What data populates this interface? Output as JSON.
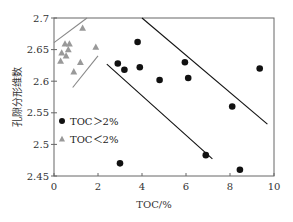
{
  "chart_data": {
    "type": "scatter",
    "title": "",
    "xlabel": "TOC/%",
    "ylabel": "孔隙分形维数",
    "xlim": [
      0,
      10
    ],
    "ylim": [
      2.45,
      2.7
    ],
    "x_ticks": [
      "0",
      "2",
      "4",
      "6",
      "8",
      "10"
    ],
    "y_ticks": [
      "2.45",
      "2.5",
      "2.55",
      "2.6",
      "2.65",
      "2.7"
    ],
    "grid": false,
    "legend_position": "inside-left",
    "series": [
      {
        "name": "TOC＞2%",
        "marker": "circle",
        "color": "#111111",
        "points": [
          [
            2.9,
            2.628
          ],
          [
            3.2,
            2.618
          ],
          [
            3.8,
            2.662
          ],
          [
            3.9,
            2.622
          ],
          [
            4.8,
            2.602
          ],
          [
            5.95,
            2.63
          ],
          [
            6.1,
            2.605
          ],
          [
            6.9,
            2.483
          ],
          [
            8.1,
            2.56
          ],
          [
            8.45,
            2.46
          ],
          [
            9.35,
            2.62
          ],
          [
            3.0,
            2.47
          ]
        ]
      },
      {
        "name": "TOC＜2%",
        "marker": "triangle",
        "color": "#999999",
        "points": [
          [
            1.3,
            2.684
          ],
          [
            0.5,
            2.659
          ],
          [
            0.7,
            2.659
          ],
          [
            0.65,
            2.65
          ],
          [
            0.35,
            2.645
          ],
          [
            0.55,
            2.64
          ],
          [
            0.3,
            2.632
          ],
          [
            1.9,
            2.654
          ],
          [
            1.2,
            2.63
          ],
          [
            0.9,
            2.615
          ]
        ]
      }
    ],
    "reference_lines": [
      {
        "group": "TOC＜2%",
        "color": "#888888",
        "from": [
          0.0,
          2.661
        ],
        "to": [
          1.5,
          2.7
        ]
      },
      {
        "group": "TOC＜2%",
        "color": "#888888",
        "from": [
          0.85,
          2.59
        ],
        "to": [
          2.0,
          2.64
        ]
      },
      {
        "group": "TOC＞2%",
        "color": "#111111",
        "from": [
          2.4,
          2.627
        ],
        "to": [
          7.2,
          2.477
        ]
      },
      {
        "group": "TOC＞2%",
        "color": "#111111",
        "from": [
          4.0,
          2.7
        ],
        "to": [
          9.7,
          2.532
        ]
      }
    ]
  }
}
